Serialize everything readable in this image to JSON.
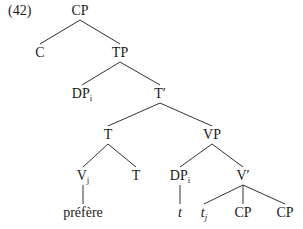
{
  "example_number": "(42)",
  "colors": {
    "line": "#333333",
    "text": "#1a1a1a",
    "background": "#ffffff"
  },
  "nodes": [
    {
      "id": "cp_root",
      "label": "CP",
      "sub": "",
      "italic": false,
      "x": 80,
      "y": 11
    },
    {
      "id": "c",
      "label": "C",
      "sub": "",
      "italic": false,
      "x": 40,
      "y": 53
    },
    {
      "id": "tp",
      "label": "TP",
      "sub": "",
      "italic": false,
      "x": 120,
      "y": 53
    },
    {
      "id": "dp_spec",
      "label": "DP",
      "sub": "i",
      "italic": false,
      "x": 82,
      "y": 94
    },
    {
      "id": "tbar",
      "label": "T′",
      "sub": "",
      "italic": false,
      "x": 160,
      "y": 94
    },
    {
      "id": "t_head",
      "label": "T",
      "sub": "",
      "italic": false,
      "x": 108,
      "y": 135
    },
    {
      "id": "vp",
      "label": "VP",
      "sub": "",
      "italic": false,
      "x": 212,
      "y": 135
    },
    {
      "id": "v_j",
      "label": "V",
      "sub": "j",
      "italic": false,
      "x": 83,
      "y": 176
    },
    {
      "id": "t_low",
      "label": "T",
      "sub": "",
      "italic": false,
      "x": 136,
      "y": 176
    },
    {
      "id": "dp_vp",
      "label": "DP",
      "sub": "i",
      "italic": false,
      "x": 180,
      "y": 176
    },
    {
      "id": "vbar",
      "label": "V′",
      "sub": "",
      "italic": false,
      "x": 243,
      "y": 176
    },
    {
      "id": "prefere",
      "label": "préfère",
      "sub": "",
      "italic": false,
      "x": 83,
      "y": 213
    },
    {
      "id": "trace_t",
      "label": "t",
      "sub": "",
      "italic": true,
      "x": 180,
      "y": 213
    },
    {
      "id": "trace_tj",
      "label": "t",
      "sub": "j",
      "italic": true,
      "x": 204,
      "y": 213
    },
    {
      "id": "cp_1",
      "label": "CP",
      "sub": "",
      "italic": false,
      "x": 243,
      "y": 213
    },
    {
      "id": "cp_2",
      "label": "CP",
      "sub": "",
      "italic": false,
      "x": 285,
      "y": 213
    }
  ],
  "edges": [
    [
      "cp_root",
      "c"
    ],
    [
      "cp_root",
      "tp"
    ],
    [
      "tp",
      "dp_spec"
    ],
    [
      "tp",
      "tbar"
    ],
    [
      "tbar",
      "t_head"
    ],
    [
      "tbar",
      "vp"
    ],
    [
      "t_head",
      "v_j"
    ],
    [
      "t_head",
      "t_low"
    ],
    [
      "vp",
      "dp_vp"
    ],
    [
      "vp",
      "vbar"
    ],
    [
      "v_j",
      "prefere"
    ],
    [
      "dp_vp",
      "trace_t"
    ],
    [
      "vbar",
      "trace_tj"
    ],
    [
      "vbar",
      "cp_1"
    ],
    [
      "vbar",
      "cp_2"
    ]
  ]
}
